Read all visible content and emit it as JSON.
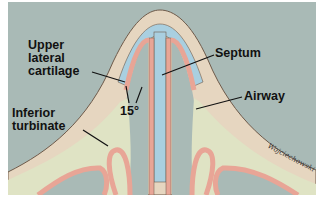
{
  "figure": {
    "labels": {
      "upper_lateral_cartilage": [
        "Upper",
        "lateral",
        "cartilage"
      ],
      "septum": "Septum",
      "airway": "Airway",
      "inferior_turbinate": [
        "Inferior",
        "turbinate"
      ],
      "angle": "15°"
    },
    "signature": "Wojciechowski",
    "colors": {
      "background": "#a9bab6",
      "skin": "#e6d6c0",
      "cartilage": "#a9cfe0",
      "mucosa": "#e8a596",
      "bone": "#dfe3c4",
      "outline": "#6e5a4a",
      "leader": "#111111"
    }
  }
}
